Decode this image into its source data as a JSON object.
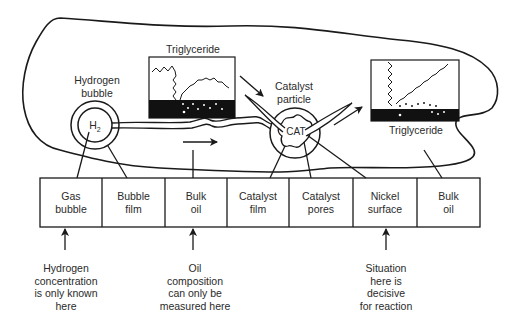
{
  "labels": {
    "hydrogen_bubble": [
      "Hydrogen",
      "bubble"
    ],
    "h2": "H",
    "h2_sub": "2",
    "triglyceride_top": "Triglyceride",
    "catalyst_particle": [
      "Catalyst",
      "particle"
    ],
    "cat": "CAT",
    "triglyceride_right": "Triglyceride"
  },
  "stages": [
    {
      "line1": "Gas",
      "line2": "bubble"
    },
    {
      "line1": "Bubble",
      "line2": "film"
    },
    {
      "line1": "Bulk",
      "line2": "oil"
    },
    {
      "line1": "Catalyst",
      "line2": "film"
    },
    {
      "line1": "Catalyst",
      "line2": "pores"
    },
    {
      "line1": "Nickel",
      "line2": "surface"
    },
    {
      "line1": "Bulk",
      "line2": "oil"
    }
  ],
  "notes": [
    {
      "lines": [
        "Hydrogen",
        "concentration",
        "is only known",
        "here"
      ]
    },
    {
      "lines": [
        "Oil",
        "composition",
        "can only be",
        "measured here"
      ]
    },
    {
      "lines": [
        "Situation",
        "here is",
        "decisive",
        "for reaction"
      ]
    }
  ],
  "colors": {
    "ink": "#1a1a1a",
    "background": "#ffffff"
  }
}
